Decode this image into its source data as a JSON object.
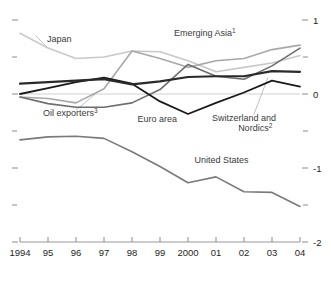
{
  "chart_data": {
    "type": "line",
    "title": "",
    "subtitle": "",
    "xlabel": "",
    "ylabel": "",
    "x": [
      1994,
      1995,
      1996,
      1997,
      1998,
      1999,
      2000,
      2001,
      2002,
      2003,
      2004
    ],
    "tick_labels": [
      "1994",
      "95",
      "96",
      "97",
      "98",
      "99",
      "2000",
      "01",
      "02",
      "03",
      "04"
    ],
    "y_ticks": [
      1,
      0,
      -1,
      -2
    ],
    "y_tick_labels": [
      "1",
      "0",
      "-1",
      "-2"
    ],
    "ylim": [
      -2,
      1
    ],
    "xlim": [
      1994,
      2004
    ],
    "grid": false,
    "legend_position": "inline-annotations",
    "zero_line": 0,
    "series": [
      {
        "name": "Japan",
        "color": "#c8c8c8",
        "width": 1.6,
        "values": [
          0.82,
          0.62,
          0.48,
          0.5,
          0.58,
          0.57,
          0.45,
          0.3,
          0.36,
          0.42,
          0.52
        ]
      },
      {
        "name": "Emerging Asia",
        "footnote": "1",
        "color": "#a8a8a8",
        "width": 1.6,
        "values": [
          -0.04,
          -0.06,
          -0.12,
          0.07,
          0.58,
          0.48,
          0.36,
          0.45,
          0.48,
          0.6,
          0.66
        ]
      },
      {
        "name": "Oil exporters",
        "footnote": "3",
        "color": "#6e6e6e",
        "width": 1.6,
        "values": [
          -0.04,
          -0.13,
          -0.18,
          -0.18,
          -0.12,
          0.06,
          0.4,
          0.24,
          0.2,
          0.38,
          0.62
        ]
      },
      {
        "name": "Euro area",
        "color": "#1a1a1a",
        "width": 1.8,
        "values": [
          0.0,
          0.08,
          0.16,
          0.22,
          0.14,
          -0.1,
          -0.27,
          -0.12,
          0.02,
          0.18,
          0.1
        ]
      },
      {
        "name": "Switzerland and Nordics",
        "footnote": "2",
        "color": "#2a2a2a",
        "width": 2.2,
        "values": [
          0.14,
          0.16,
          0.18,
          0.2,
          0.13,
          0.17,
          0.23,
          0.24,
          0.24,
          0.31,
          0.3
        ]
      },
      {
        "name": "United States",
        "color": "#7a7a7a",
        "width": 1.6,
        "values": [
          -0.62,
          -0.58,
          -0.57,
          -0.6,
          -0.78,
          -0.98,
          -1.2,
          -1.12,
          -1.32,
          -1.33,
          -1.52
        ]
      }
    ],
    "annotations": [
      {
        "text": "Japan",
        "x": 1995.4,
        "y": 0.7
      },
      {
        "text": "Emerging Asia",
        "footnote": "1",
        "x": 2000.6,
        "y": 0.78
      },
      {
        "text": "Oil exporters",
        "footnote": "3",
        "x": 1995.8,
        "y": -0.3
      },
      {
        "text": "Euro area",
        "x": 1998.9,
        "y": -0.38
      },
      {
        "text": "Switzerland and",
        "x": 2002.0,
        "y": -0.36
      },
      {
        "text": "Nordics",
        "footnote": "2",
        "x": 2002.4,
        "y": -0.5
      },
      {
        "text": "United States",
        "x": 2001.2,
        "y": -0.93
      }
    ]
  }
}
